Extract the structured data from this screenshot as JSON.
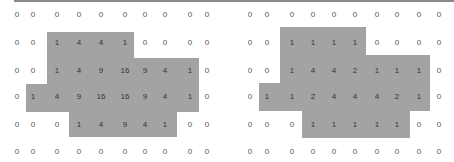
{
  "grids": [
    {
      "name": "left",
      "values": [
        [
          0,
          0,
          0,
          0,
          0,
          0,
          0,
          0,
          0,
          0
        ],
        [
          0,
          0,
          1,
          4,
          4,
          1,
          0,
          0,
          0,
          0
        ],
        [
          0,
          0,
          1,
          4,
          9,
          16,
          9,
          4,
          1,
          0
        ],
        [
          0,
          1,
          4,
          9,
          16,
          16,
          9,
          4,
          1,
          0
        ],
        [
          0,
          0,
          0,
          1,
          4,
          9,
          4,
          1,
          0,
          0
        ],
        [
          0,
          0,
          0,
          0,
          0,
          0,
          0,
          0,
          0,
          0
        ]
      ],
      "shaded": [
        [
          0,
          0,
          0,
          0,
          0,
          0,
          0,
          0,
          0,
          0
        ],
        [
          0,
          0,
          1,
          1,
          1,
          1,
          0,
          0,
          0,
          0
        ],
        [
          0,
          0,
          1,
          1,
          1,
          1,
          1,
          1,
          1,
          0
        ],
        [
          0,
          1,
          1,
          1,
          1,
          1,
          1,
          1,
          1,
          0
        ],
        [
          0,
          0,
          0,
          1,
          1,
          1,
          1,
          1,
          0,
          0
        ],
        [
          0,
          0,
          0,
          0,
          0,
          0,
          0,
          0,
          0,
          0
        ]
      ]
    },
    {
      "name": "right",
      "values": [
        [
          0,
          0,
          0,
          0,
          0,
          0,
          0,
          0,
          0,
          0
        ],
        [
          0,
          0,
          1,
          1,
          1,
          1,
          0,
          0,
          0,
          0
        ],
        [
          0,
          0,
          1,
          4,
          4,
          2,
          1,
          1,
          1,
          0
        ],
        [
          0,
          1,
          1,
          2,
          4,
          4,
          4,
          2,
          1,
          0
        ],
        [
          0,
          0,
          0,
          1,
          1,
          1,
          1,
          1,
          0,
          0
        ],
        [
          0,
          0,
          0,
          0,
          0,
          0,
          0,
          0,
          0,
          0
        ]
      ],
      "shaded": [
        [
          0,
          0,
          0,
          0,
          0,
          0,
          0,
          0,
          0,
          0
        ],
        [
          0,
          0,
          1,
          1,
          1,
          1,
          0,
          0,
          0,
          0
        ],
        [
          0,
          0,
          1,
          1,
          1,
          1,
          1,
          1,
          1,
          0
        ],
        [
          0,
          1,
          1,
          1,
          1,
          1,
          1,
          1,
          1,
          0
        ],
        [
          0,
          0,
          0,
          1,
          1,
          1,
          1,
          1,
          0,
          0
        ],
        [
          0,
          0,
          0,
          0,
          0,
          0,
          0,
          0,
          0,
          0
        ]
      ]
    }
  ],
  "colors": {
    "shade": "#a3a3a3",
    "border": "#8a8a8a"
  }
}
